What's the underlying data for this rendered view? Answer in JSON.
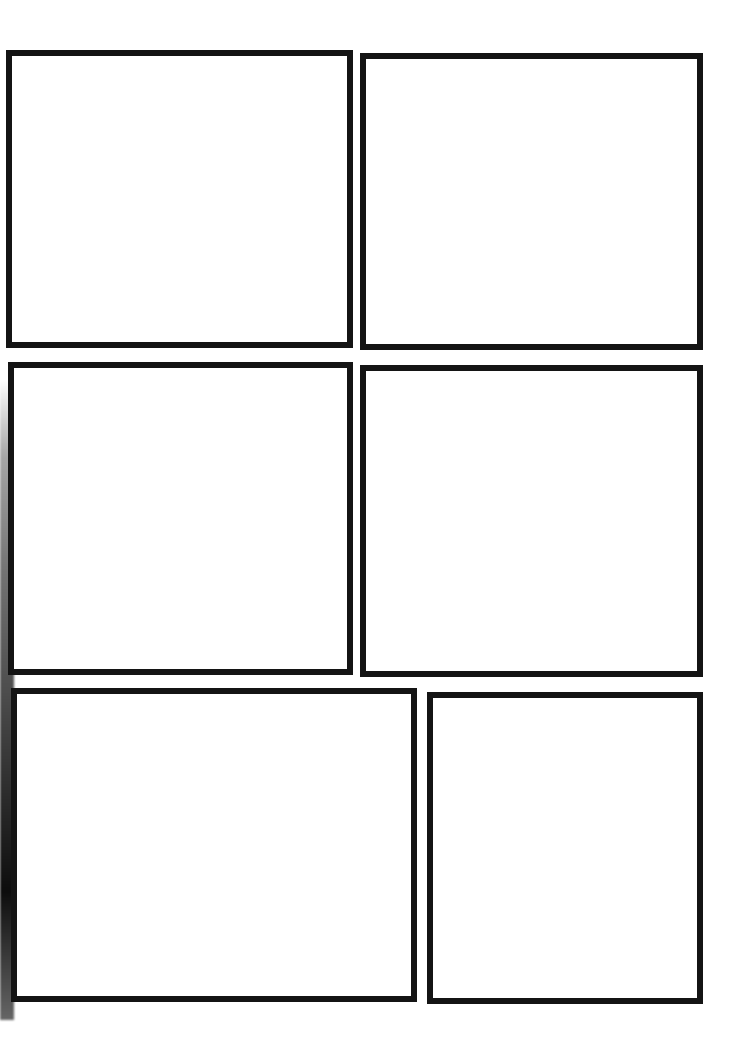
{
  "page": {
    "type": "comic-storyboard-template",
    "border_color": "#141414",
    "background_color": "#ffffff"
  },
  "panels": [
    {
      "id": 1,
      "row": 1,
      "x": 6,
      "y": 50,
      "width": 347,
      "height": 298
    },
    {
      "id": 2,
      "row": 1,
      "x": 360,
      "y": 53,
      "width": 343,
      "height": 297
    },
    {
      "id": 3,
      "row": 2,
      "x": 8,
      "y": 362,
      "width": 345,
      "height": 313
    },
    {
      "id": 4,
      "row": 2,
      "x": 360,
      "y": 365,
      "width": 343,
      "height": 312
    },
    {
      "id": 5,
      "row": 3,
      "x": 11,
      "y": 688,
      "width": 406,
      "height": 314
    },
    {
      "id": 6,
      "row": 3,
      "x": 427,
      "y": 692,
      "width": 276,
      "height": 312
    }
  ]
}
